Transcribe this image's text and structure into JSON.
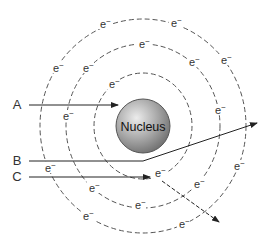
{
  "diagram": {
    "nucleus": {
      "label": "Nucleus",
      "cx": 143,
      "cy": 126,
      "r": 27
    },
    "orbits": [
      {
        "name": "inner",
        "rx": 49,
        "ry": 53
      },
      {
        "name": "middle",
        "rx": 77,
        "ry": 82
      },
      {
        "name": "outer",
        "rx": 103,
        "ry": 107
      }
    ],
    "electron_symbol": "e−",
    "electrons": [
      [
        104,
        25
      ],
      [
        175,
        24
      ],
      [
        143,
        45
      ],
      [
        57,
        69
      ],
      [
        87,
        69
      ],
      [
        193,
        63
      ],
      [
        225,
        61
      ],
      [
        113,
        85
      ],
      [
        219,
        111
      ],
      [
        67,
        117
      ],
      [
        49,
        169
      ],
      [
        159,
        174
      ],
      [
        238,
        167
      ],
      [
        93,
        189
      ],
      [
        198,
        185
      ],
      [
        139,
        206
      ],
      [
        87,
        217
      ],
      [
        183,
        225
      ]
    ],
    "particles": [
      {
        "label": "A",
        "lx": 17,
        "ly": 109,
        "path": "M29,105 L118,105",
        "dashed": false,
        "arrow": true
      },
      {
        "label": "B",
        "lx": 17,
        "ly": 165,
        "path": "M29,161 L143,161 L257,123",
        "dashed": false,
        "arrow": true
      },
      {
        "label": "C",
        "lx": 17,
        "ly": 181,
        "path": "M29,177 L150,177",
        "dashed": false,
        "arrow": true
      },
      {
        "label": "",
        "path": "M162,181 L219,222",
        "dashed": true,
        "arrow": true
      }
    ]
  }
}
